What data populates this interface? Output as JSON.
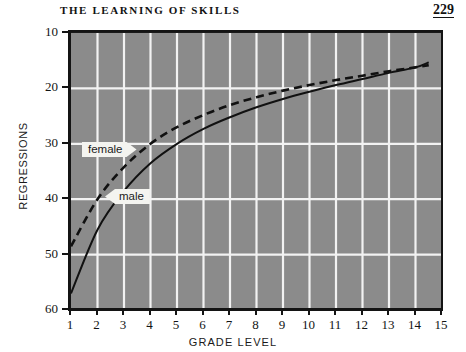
{
  "page": {
    "running_head": "THE  LEARNING  OF  SKILLS",
    "number": "229"
  },
  "chart_data": {
    "type": "line",
    "title": "",
    "xlabel": "GRADE LEVEL",
    "ylabel": "REGRESSIONS",
    "xlim": [
      1,
      15
    ],
    "ylim": [
      10,
      60
    ],
    "y_inverted": true,
    "grid": true,
    "legend_position": "inline-callout",
    "x_ticks": [
      "1",
      "2",
      "3",
      "4",
      "5",
      "6",
      "7",
      "8",
      "9",
      "10",
      "11",
      "12",
      "13",
      "14",
      "15"
    ],
    "y_ticks": [
      "10",
      "20",
      "30",
      "40",
      "50",
      "60"
    ],
    "x": [
      1,
      2,
      3,
      4,
      5,
      6,
      7,
      8,
      9,
      10,
      11,
      12,
      13,
      14,
      14.5
    ],
    "series": [
      {
        "name": "female",
        "label": "female",
        "style": "dashed",
        "color": "#111111",
        "values": [
          48.5,
          40.0,
          34.2,
          30.0,
          27.0,
          24.8,
          23.0,
          21.6,
          20.4,
          19.4,
          18.5,
          17.7,
          16.9,
          16.2,
          15.8
        ]
      },
      {
        "name": "male",
        "label": "male",
        "style": "solid",
        "color": "#111111",
        "values": [
          57.0,
          45.5,
          38.5,
          33.5,
          30.0,
          27.3,
          25.2,
          23.4,
          21.9,
          20.6,
          19.4,
          18.3,
          17.2,
          16.2,
          15.3
        ]
      }
    ],
    "colors": {
      "plot_background": "#8b8b8b",
      "gridline": "#f2f2f2",
      "axis": "#141414",
      "page_background": "#ffffff"
    }
  }
}
